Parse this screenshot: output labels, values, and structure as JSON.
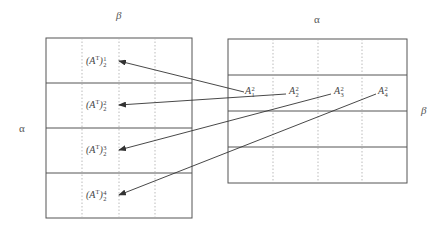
{
  "left_matrix": {
    "top_label": "β",
    "side_label": "α",
    "rows": [
      {
        "base": "(A",
        "sup_T": "T",
        "close": ")",
        "sup": "1",
        "sub": "2"
      },
      {
        "base": "(A",
        "sup_T": "T",
        "close": ")",
        "sup": "2",
        "sub": "2"
      },
      {
        "base": "(A",
        "sup_T": "T",
        "close": ")",
        "sup": "3",
        "sub": "2"
      },
      {
        "base": "(A",
        "sup_T": "T",
        "close": ")",
        "sup": "4",
        "sub": "2"
      }
    ]
  },
  "right_matrix": {
    "top_label": "α",
    "side_label": "β",
    "row_labels": [
      {
        "base": "A",
        "sup": "2",
        "sub": "1"
      },
      {
        "base": "A",
        "sup": "2",
        "sub": "2"
      },
      {
        "base": "A",
        "sup": "2",
        "sub": "3"
      },
      {
        "base": "A",
        "sup": "2",
        "sub": "4"
      }
    ]
  },
  "colors": {
    "line": "#555555",
    "dotted": "#9a9a9a",
    "arrow": "#333333"
  }
}
